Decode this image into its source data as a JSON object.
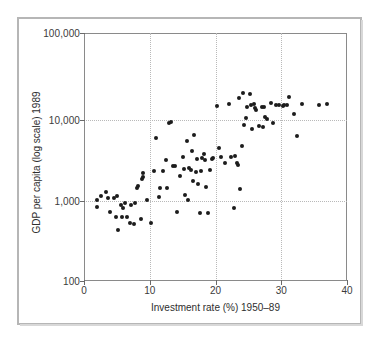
{
  "chart_data": {
    "type": "scatter",
    "title": "",
    "xlabel": "Investment rate (%) 1950–89",
    "ylabel": "GDP per capita (log scale) 1989",
    "xlim": [
      0,
      40
    ],
    "ylim": [
      100,
      100000
    ],
    "yscale": "log",
    "xscale": "linear",
    "grid": true,
    "grid_style": "dotted",
    "legend": "none",
    "xticks": [
      0,
      10,
      20,
      30,
      40
    ],
    "xtick_labels": [
      "0",
      "10",
      "20",
      "30",
      "40"
    ],
    "yticks": [
      100,
      1000,
      10000,
      100000
    ],
    "ytick_labels": [
      "100",
      "1,000",
      "10,000",
      "100,000"
    ],
    "marker": "filled-circle",
    "marker_color": "#1c1c1c",
    "points": [
      {
        "x": 2.0,
        "y": 950
      },
      {
        "x": 2.0,
        "y": 780
      },
      {
        "x": 2.6,
        "y": 1080
      },
      {
        "x": 3.4,
        "y": 1180
      },
      {
        "x": 3.6,
        "y": 1020
      },
      {
        "x": 4.0,
        "y": 690
      },
      {
        "x": 4.6,
        "y": 1000
      },
      {
        "x": 4.8,
        "y": 600
      },
      {
        "x": 5.0,
        "y": 1060
      },
      {
        "x": 5.2,
        "y": 415
      },
      {
        "x": 5.6,
        "y": 830
      },
      {
        "x": 5.8,
        "y": 590
      },
      {
        "x": 6.0,
        "y": 770
      },
      {
        "x": 6.2,
        "y": 880
      },
      {
        "x": 6.6,
        "y": 600
      },
      {
        "x": 7.0,
        "y": 500
      },
      {
        "x": 7.2,
        "y": 830
      },
      {
        "x": 7.6,
        "y": 490
      },
      {
        "x": 7.8,
        "y": 880
      },
      {
        "x": 8.0,
        "y": 1320
      },
      {
        "x": 8.2,
        "y": 1420
      },
      {
        "x": 8.6,
        "y": 570
      },
      {
        "x": 8.8,
        "y": 1720
      },
      {
        "x": 8.9,
        "y": 1800
      },
      {
        "x": 9.0,
        "y": 2050
      },
      {
        "x": 9.6,
        "y": 950
      },
      {
        "x": 10.2,
        "y": 510
      },
      {
        "x": 10.6,
        "y": 2150
      },
      {
        "x": 11.0,
        "y": 5400
      },
      {
        "x": 11.4,
        "y": 1030
      },
      {
        "x": 11.6,
        "y": 1350
      },
      {
        "x": 12.0,
        "y": 2150
      },
      {
        "x": 12.4,
        "y": 2900
      },
      {
        "x": 12.6,
        "y": 1350
      },
      {
        "x": 13.0,
        "y": 8100
      },
      {
        "x": 13.2,
        "y": 8300
      },
      {
        "x": 13.6,
        "y": 2450
      },
      {
        "x": 13.8,
        "y": 2480
      },
      {
        "x": 14.2,
        "y": 680
      },
      {
        "x": 14.6,
        "y": 1850
      },
      {
        "x": 15.0,
        "y": 3150
      },
      {
        "x": 15.2,
        "y": 2250
      },
      {
        "x": 15.4,
        "y": 1100
      },
      {
        "x": 15.6,
        "y": 4900
      },
      {
        "x": 15.8,
        "y": 960
      },
      {
        "x": 16.0,
        "y": 2300
      },
      {
        "x": 16.2,
        "y": 2220
      },
      {
        "x": 16.4,
        "y": 3700
      },
      {
        "x": 16.6,
        "y": 1620
      },
      {
        "x": 16.8,
        "y": 5900
      },
      {
        "x": 17.0,
        "y": 2100
      },
      {
        "x": 17.2,
        "y": 2950
      },
      {
        "x": 17.4,
        "y": 1500
      },
      {
        "x": 17.6,
        "y": 660
      },
      {
        "x": 17.8,
        "y": 2150
      },
      {
        "x": 18.0,
        "y": 3050
      },
      {
        "x": 18.2,
        "y": 3450
      },
      {
        "x": 18.4,
        "y": 2900
      },
      {
        "x": 18.6,
        "y": 1380
      },
      {
        "x": 18.8,
        "y": 660
      },
      {
        "x": 19.2,
        "y": 2200
      },
      {
        "x": 19.4,
        "y": 2950
      },
      {
        "x": 19.6,
        "y": 3050
      },
      {
        "x": 20.2,
        "y": 13200
      },
      {
        "x": 20.6,
        "y": 4100
      },
      {
        "x": 20.8,
        "y": 3200
      },
      {
        "x": 21.4,
        "y": 2700
      },
      {
        "x": 22.0,
        "y": 14000
      },
      {
        "x": 22.4,
        "y": 3150
      },
      {
        "x": 22.8,
        "y": 760
      },
      {
        "x": 23.0,
        "y": 3250
      },
      {
        "x": 23.2,
        "y": 2700
      },
      {
        "x": 23.4,
        "y": 2550
      },
      {
        "x": 23.6,
        "y": 16200
      },
      {
        "x": 23.8,
        "y": 1300
      },
      {
        "x": 24.0,
        "y": 4300
      },
      {
        "x": 24.2,
        "y": 18900
      },
      {
        "x": 24.4,
        "y": 7800
      },
      {
        "x": 24.6,
        "y": 9400
      },
      {
        "x": 24.8,
        "y": 12800
      },
      {
        "x": 25.2,
        "y": 18500
      },
      {
        "x": 25.4,
        "y": 13500
      },
      {
        "x": 25.6,
        "y": 6900
      },
      {
        "x": 25.8,
        "y": 14000
      },
      {
        "x": 26.0,
        "y": 12300
      },
      {
        "x": 26.2,
        "y": 11600
      },
      {
        "x": 26.6,
        "y": 7500
      },
      {
        "x": 27.0,
        "y": 12600
      },
      {
        "x": 27.2,
        "y": 7200
      },
      {
        "x": 27.4,
        "y": 12800
      },
      {
        "x": 27.6,
        "y": 9700
      },
      {
        "x": 27.8,
        "y": 9200
      },
      {
        "x": 28.4,
        "y": 14200
      },
      {
        "x": 28.8,
        "y": 8200
      },
      {
        "x": 29.2,
        "y": 13400
      },
      {
        "x": 29.6,
        "y": 13500
      },
      {
        "x": 30.2,
        "y": 13100
      },
      {
        "x": 30.4,
        "y": 13300
      },
      {
        "x": 30.8,
        "y": 13600
      },
      {
        "x": 31.2,
        "y": 16600
      },
      {
        "x": 32.0,
        "y": 10600
      },
      {
        "x": 32.4,
        "y": 5600
      },
      {
        "x": 33.2,
        "y": 13900
      },
      {
        "x": 35.8,
        "y": 13500
      },
      {
        "x": 37.0,
        "y": 13700
      }
    ]
  }
}
